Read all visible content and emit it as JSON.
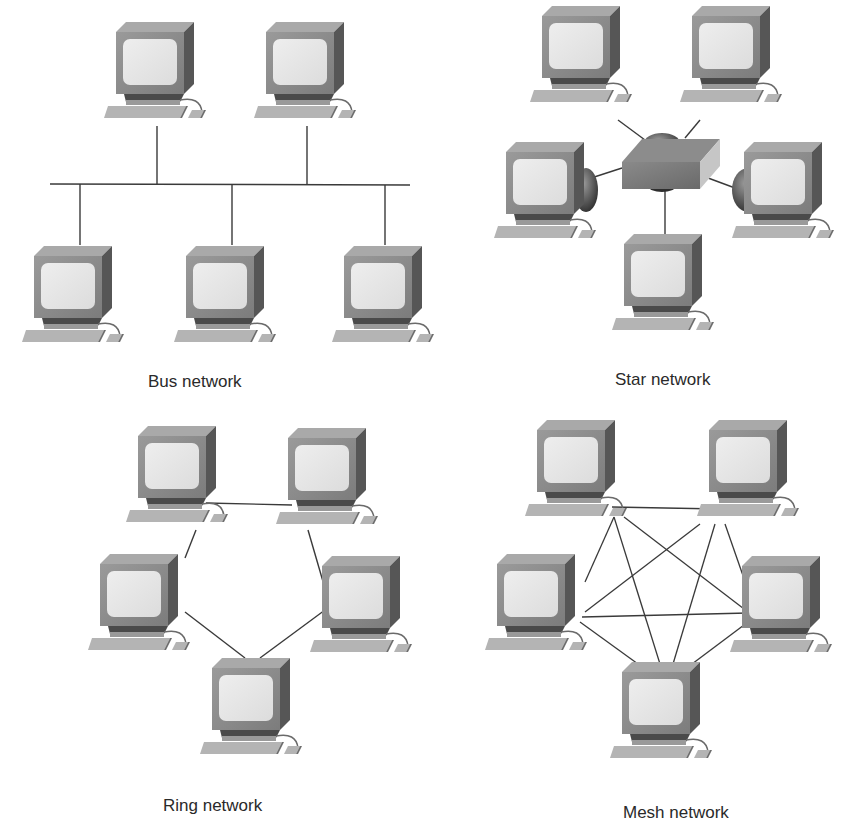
{
  "figure": {
    "panels": [
      {
        "id": "bus",
        "label": "Bus network",
        "topology": "bus",
        "computers": 5
      },
      {
        "id": "star",
        "label": "Star network",
        "topology": "star",
        "computers": 5,
        "central_device": "hub"
      },
      {
        "id": "ring",
        "label": "Ring network",
        "topology": "ring",
        "computers": 5
      },
      {
        "id": "mesh",
        "label": "Mesh network",
        "topology": "mesh",
        "computers": 5
      }
    ],
    "colors": {
      "monitor_body": "#8c8c8c",
      "monitor_side": "#5a5a5a",
      "monitor_top": "#a8a8a8",
      "screen": "#e6e6e6",
      "keyboard": "#b0b0b0",
      "cable": "#3a3a3a",
      "hub": "#7a7a7a"
    }
  }
}
